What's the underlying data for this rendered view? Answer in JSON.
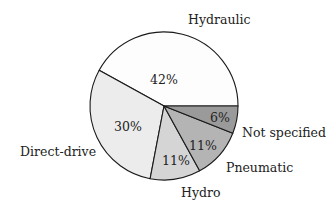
{
  "chart_data": {
    "type": "pie",
    "title": "",
    "start_angle_deg": 0,
    "direction": "counterclockwise",
    "categories": [
      "Hydraulic",
      "Direct-drive",
      "Hydro",
      "Pneumatic",
      "Not specified"
    ],
    "values": [
      42,
      30,
      11,
      11,
      6
    ],
    "value_labels": [
      "42%",
      "30%",
      "11%",
      "11%",
      "6%"
    ],
    "colors": [
      "#fdfdfd",
      "#ececec",
      "#d5d5d5",
      "#b4b4b4",
      "#9a9a9a"
    ],
    "legend": "none (labels placed outside slices)",
    "unit": "%"
  },
  "geometry": {
    "cx": 164,
    "cy": 106,
    "r": 74
  },
  "labels": {
    "hydraulic": {
      "text": "Hydraulic",
      "x": 188,
      "y": 24
    },
    "direct_drive": {
      "text": "Direct-drive",
      "x": 20,
      "y": 156
    },
    "hydro": {
      "text": "Hydro",
      "x": 181,
      "y": 197
    },
    "pneumatic": {
      "text": "Pneumatic",
      "x": 226,
      "y": 172
    },
    "not_specified": {
      "text": "Not specified",
      "x": 242,
      "y": 137
    }
  },
  "pct_labels": {
    "hydraulic": {
      "text": "42%",
      "x": 164,
      "y": 84
    },
    "direct_drive": {
      "text": "30%",
      "x": 128,
      "y": 131
    },
    "hydro": {
      "text": "11%",
      "x": 176,
      "y": 165
    },
    "pneumatic": {
      "text": "11%",
      "x": 203,
      "y": 150
    },
    "not_specified": {
      "text": "6%",
      "x": 220,
      "y": 122
    }
  }
}
